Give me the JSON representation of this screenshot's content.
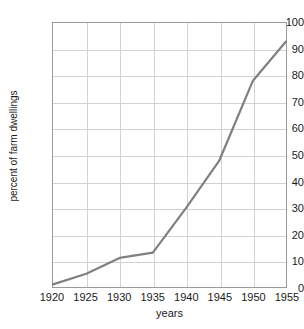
{
  "chart_data": {
    "type": "line",
    "title": "",
    "xlabel": "years",
    "ylabel": "percent of farm dwellings",
    "x": [
      1920,
      1925,
      1930,
      1935,
      1940,
      1945,
      1950,
      1955
    ],
    "values": [
      1,
      5,
      11,
      13,
      30,
      48,
      78,
      93
    ],
    "series": [
      {
        "name": "percent of farm dwellings",
        "values": [
          1,
          5,
          11,
          13,
          30,
          48,
          78,
          93
        ]
      }
    ],
    "xtick_labels": [
      "1920",
      "1925",
      "1930",
      "1935",
      "1940",
      "1945",
      "1950",
      "1955"
    ],
    "ytick_labels": [
      "0",
      "10",
      "20",
      "30",
      "40",
      "50",
      "60",
      "70",
      "80",
      "90",
      "100"
    ],
    "yticks": [
      0,
      10,
      20,
      30,
      40,
      50,
      60,
      70,
      80,
      90,
      100
    ],
    "xlim": [
      1920,
      1955
    ],
    "ylim": [
      0,
      100
    ],
    "grid": true,
    "legend": "none",
    "line_color": "#808080",
    "grid_color": "#d2d2d2",
    "axis_color": "#9a9a9a"
  }
}
